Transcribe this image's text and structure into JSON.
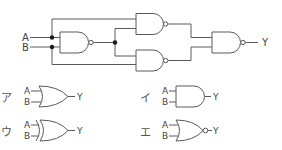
{
  "circuit": {
    "inputs": [
      "A",
      "B"
    ],
    "output": "Y",
    "gates": [
      {
        "id": "g1",
        "type": "NAND",
        "inputs": [
          "A",
          "B"
        ]
      },
      {
        "id": "g2",
        "type": "NAND",
        "inputs": [
          "A",
          "g1"
        ]
      },
      {
        "id": "g3",
        "type": "NAND",
        "inputs": [
          "g1",
          "B"
        ]
      },
      {
        "id": "g4",
        "type": "NAND",
        "inputs": [
          "g2",
          "g3"
        ],
        "output": "Y"
      }
    ]
  },
  "options": [
    {
      "marker": "ア",
      "gate": "OR",
      "in_a": "A",
      "in_b": "B",
      "out": "Y"
    },
    {
      "marker": "イ",
      "gate": "AND",
      "in_a": "A",
      "in_b": "B",
      "out": "Y"
    },
    {
      "marker": "ウ",
      "gate": "XOR",
      "in_a": "A",
      "in_b": "B",
      "out": "Y"
    },
    {
      "marker": "エ",
      "gate": "NOR",
      "in_a": "A",
      "in_b": "B",
      "out": "Y"
    }
  ],
  "colors": {
    "line": "#5a5a5a",
    "junction": "#1a1a1a",
    "text": "#444444"
  }
}
